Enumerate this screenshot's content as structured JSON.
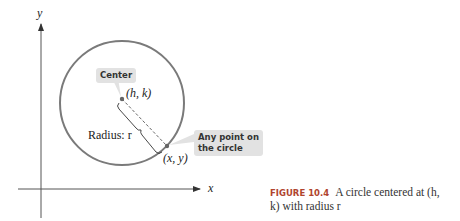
{
  "figure": {
    "axes": {
      "x_label": "x",
      "y_label": "y"
    },
    "center_callout": "Center",
    "center_point": "(h, k)",
    "radius_label": "Radius: r",
    "point_callout_line1": "Any point on",
    "point_callout_line2": "the circle",
    "circle_point": "(x, y)",
    "colors": {
      "circle": "#7a7a7a",
      "caption_label": "#b0442e",
      "callout_bg": "#e2e2e2"
    }
  },
  "caption": {
    "label": "FIGURE 10.4",
    "text": "A circle centered at (h, k) with radius r"
  }
}
